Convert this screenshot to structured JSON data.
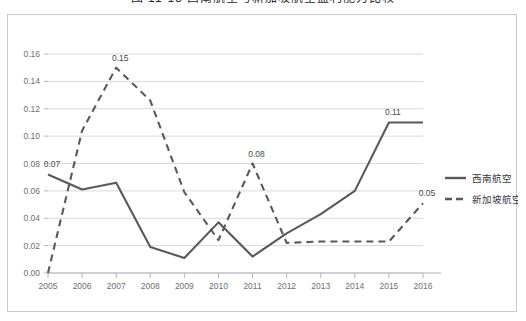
{
  "figure": {
    "title": "图 11-13  西南航空与新加坡航空盈利能力比较"
  },
  "legend": {
    "position": "right",
    "items": [
      {
        "label": "西南航空",
        "style": "solid",
        "color": "#595959"
      },
      {
        "label": "新加坡航空",
        "style": "dashed",
        "color": "#595959"
      }
    ]
  },
  "chart_data": {
    "type": "line",
    "title": "图 11-13  西南航空与新加坡航空盈利能力比较",
    "xlabel": "",
    "ylabel": "",
    "grid": true,
    "legend_position": "right",
    "x": [
      "2005",
      "2006",
      "2007",
      "2008",
      "2009",
      "2010",
      "2011",
      "2012",
      "2013",
      "2014",
      "2015",
      "2016"
    ],
    "xlim": [
      "2005",
      "2016"
    ],
    "ylim": [
      0.0,
      0.16
    ],
    "ytick_labels": [
      "0.00",
      "0.02",
      "0.04",
      "0.06",
      "0.08",
      "0.10",
      "0.12",
      "0.14",
      "0.16"
    ],
    "ytick_values": [
      0.0,
      0.02,
      0.04,
      0.06,
      0.08,
      0.1,
      0.12,
      0.14,
      0.16
    ],
    "series": [
      {
        "name": "西南航空",
        "style": "solid",
        "color": "#595959",
        "values": [
          0.072,
          0.061,
          0.066,
          0.019,
          0.011,
          0.037,
          0.012,
          0.029,
          0.043,
          0.06,
          0.11,
          0.11
        ]
      },
      {
        "name": "新加坡航空",
        "style": "dashed",
        "color": "#595959",
        "values": [
          0.0,
          0.104,
          0.15,
          0.126,
          0.059,
          0.024,
          0.08,
          0.022,
          0.023,
          0.023,
          0.023,
          0.051
        ]
      }
    ],
    "annotations": [
      {
        "text": "0.07",
        "series": "西南航空",
        "x": "2005",
        "y": 0.072
      },
      {
        "text": "0.15",
        "series": "新加坡航空",
        "x": "2007",
        "y": 0.15
      },
      {
        "text": "0.08",
        "series": "新加坡航空",
        "x": "2011",
        "y": 0.08
      },
      {
        "text": "0.11",
        "series": "西南航空",
        "x": "2015",
        "y": 0.11
      },
      {
        "text": "0.05",
        "series": "新加坡航空",
        "x": "2016",
        "y": 0.051
      }
    ]
  }
}
